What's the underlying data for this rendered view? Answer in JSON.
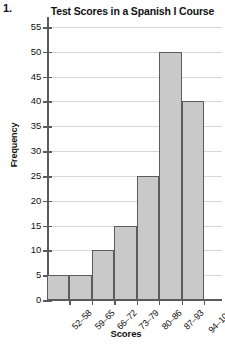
{
  "problem_number": "1.",
  "chart_data": {
    "type": "bar",
    "title": "Test Scores in a Spanish I Course",
    "xlabel": "Scores",
    "ylabel": "Frequency",
    "categories": [
      "52–58",
      "59–65",
      "66–72",
      "73–79",
      "80–86",
      "87–93",
      "94–100"
    ],
    "values": [
      5,
      5,
      10,
      15,
      25,
      50,
      40
    ],
    "ylim": [
      0,
      55
    ],
    "ytick_step": 5,
    "yticks": [
      0,
      5,
      10,
      15,
      20,
      25,
      30,
      35,
      40,
      45,
      50,
      55
    ],
    "grid": true,
    "legend": false,
    "bar_fill": "#c9c9c9",
    "bar_border": "#5c5c5c",
    "grid_color": "#d6d6d6",
    "axis_color": "#5a5a5a"
  }
}
